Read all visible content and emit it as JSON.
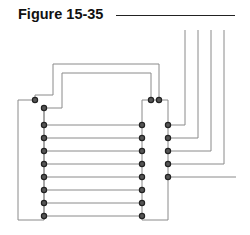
{
  "figure": {
    "title": "Figure 15-35"
  },
  "colors": {
    "wire": "#8a8a8a",
    "node_fill": "#555555",
    "node_stroke": "#222222",
    "title": "#111111"
  },
  "diagram": {
    "left_column_x": 44,
    "right_column_x": 142,
    "far_right_column_x": 168,
    "row_ys": [
      125,
      138,
      151,
      164,
      177,
      190,
      203,
      216
    ],
    "right_node_ys": [
      125,
      138,
      151,
      164,
      177
    ],
    "external_vertical_xs": [
      185,
      198,
      211,
      224
    ],
    "top_node_pair": [
      {
        "x": 151,
        "y": 100
      },
      {
        "x": 159,
        "y": 100
      }
    ],
    "left_top_nodes": [
      {
        "x": 35,
        "y": 100
      },
      {
        "x": 44,
        "y": 108
      }
    ]
  }
}
